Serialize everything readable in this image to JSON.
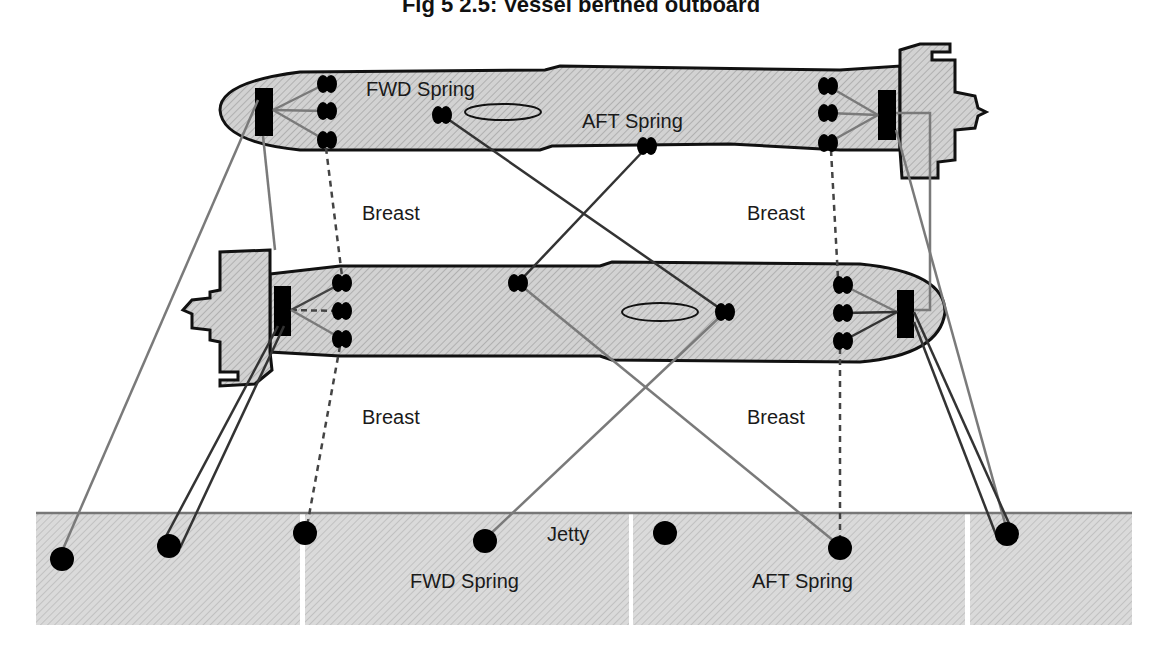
{
  "title": "Fig 5 2.5: Vessel berthed outboard",
  "labels": {
    "fwd_spring_top": "FWD Spring",
    "aft_spring_top": "AFT Spring",
    "breast_upper_left": "Breast",
    "breast_upper_right": "Breast",
    "breast_lower_left": "Breast",
    "breast_lower_right": "Breast",
    "jetty": "Jetty",
    "fwd_spring_jetty": "FWD Spring",
    "aft_spring_jetty": "AFT Spring"
  },
  "colors": {
    "hull_fill": "#cfcfcf",
    "outline": "#111111",
    "line_dark": "#333333",
    "line_grey": "#7a7a7a",
    "jetty_fill": "#d6d6d6"
  },
  "elements": {
    "outboard_vessel": "Outboard vessel (top, bow left)",
    "inboard_vessel": "Inboard vessel (middle, bow right)",
    "jetty_sections": 4,
    "bollards_on_jetty": 7
  }
}
